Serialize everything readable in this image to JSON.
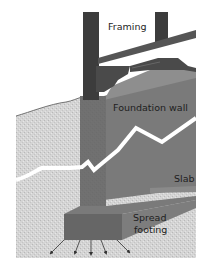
{
  "diagram": {
    "labels": {
      "framing": "Framing",
      "foundation_wall": "Foundation wall",
      "slab": "Slab",
      "spread_footing_line1": "Spread",
      "spread_footing_line2": "footing"
    },
    "colors": {
      "background": "#ffffff",
      "framing_dark": "#3a3a3a",
      "framing_beam": "#555555",
      "wall_front": "#6a6a6a",
      "wall_side": "#7d7d7d",
      "wall_top": "#8c8c8c",
      "soil": "#d6d6d6",
      "soil_line": "#555555",
      "crack": "#ffffff",
      "footing": "#6b6b6b",
      "slab": "#8a8a8a",
      "arrows": "#333333"
    },
    "load_arrows": 5
  }
}
